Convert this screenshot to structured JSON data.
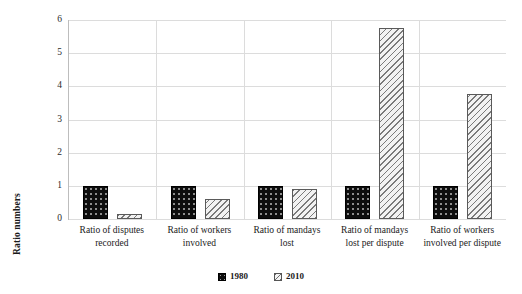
{
  "chart_data": {
    "type": "bar",
    "title": "",
    "xlabel": "",
    "ylabel": "Ratio numbers",
    "ylim": [
      0,
      6
    ],
    "yticks": [
      "0",
      "1",
      "2",
      "3",
      "4",
      "5",
      "6"
    ],
    "grid": true,
    "legend_position": "bottom-center",
    "categories": [
      "Ratio of disputes recorded",
      "Ratio of workers involved",
      "Ratio of mandays lost",
      "Ratio of mandays lost per dispute",
      "Ratio of workers involved per dispute"
    ],
    "series": [
      {
        "name": "1980",
        "color": "#0d0d0d",
        "pattern": "dotted-fill",
        "values": [
          1,
          1,
          1,
          1,
          1
        ]
      },
      {
        "name": "2010",
        "color": "#f2f2f2",
        "pattern": "diagonal-hatch",
        "values": [
          0.15,
          0.6,
          0.9,
          5.75,
          3.78
        ]
      }
    ]
  },
  "axis": {
    "y_title": "Ratio numbers"
  },
  "legend": {
    "entries": [
      {
        "label": "1980"
      },
      {
        "label": "2010"
      }
    ]
  }
}
